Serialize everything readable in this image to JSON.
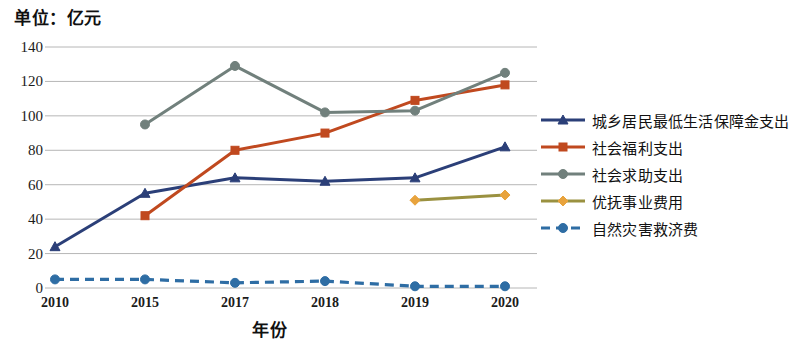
{
  "title": "单位：亿元",
  "axis": {
    "x_title": "年份",
    "y_ticks": [
      "140",
      "120",
      "100",
      "80",
      "60",
      "40",
      "20",
      "0"
    ],
    "x_ticks": [
      "2010",
      "2015",
      "2017",
      "2018",
      "2019",
      "2020"
    ]
  },
  "legend": {
    "items": [
      {
        "label": "城乡居民最低生活保障金支出",
        "color": "#2b3f78",
        "marker": "triangle",
        "dash": false
      },
      {
        "label": "社会福利支出",
        "color": "#c0491f",
        "marker": "square",
        "dash": false
      },
      {
        "label": "社会求助支出",
        "color": "#71807c",
        "marker": "circle",
        "dash": false
      },
      {
        "label": "优抚事业费用",
        "color": "#9a9140",
        "marker": "diamond",
        "dash": false
      },
      {
        "label": "自然灾害救济费",
        "color": "#2e6da4",
        "marker": "circle",
        "dash": true
      }
    ]
  },
  "chart_data": {
    "type": "line",
    "title": "单位：亿元",
    "xlabel": "年份",
    "ylabel": "亿元",
    "categories": [
      "2010",
      "2015",
      "2017",
      "2018",
      "2019",
      "2020"
    ],
    "ylim": [
      0,
      140
    ],
    "ytick_step": 20,
    "grid": true,
    "legend_position": "right",
    "series": [
      {
        "name": "城乡居民最低生活保障金支出",
        "color": "#2b3f78",
        "marker": "triangle",
        "dash": false,
        "values": [
          24,
          55,
          64,
          62,
          64,
          82
        ]
      },
      {
        "name": "社会福利支出",
        "color": "#c0491f",
        "marker": "square",
        "dash": false,
        "values": [
          null,
          42,
          80,
          90,
          109,
          118
        ]
      },
      {
        "name": "社会求助支出",
        "color": "#71807c",
        "marker": "circle",
        "dash": false,
        "values": [
          null,
          95,
          129,
          102,
          103,
          125
        ]
      },
      {
        "name": "优抚事业费用",
        "color": "#9a9140",
        "marker": "diamond",
        "dash": false,
        "values": [
          null,
          null,
          null,
          null,
          51,
          54
        ]
      },
      {
        "name": "自然灾害救济费",
        "color": "#2e6da4",
        "marker": "circle",
        "dash": true,
        "values": [
          5,
          5,
          3,
          4,
          1,
          1
        ]
      }
    ]
  },
  "plot_geometry": {
    "left": 55,
    "right": 505,
    "top": 47,
    "bottom": 288,
    "grid_color": "#b6b6b6"
  }
}
